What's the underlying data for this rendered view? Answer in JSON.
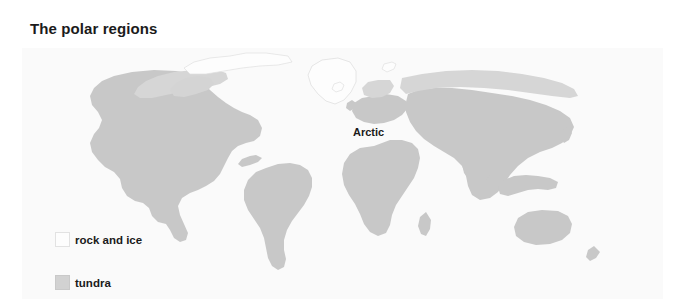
{
  "figure": {
    "title": "The polar regions",
    "background_color": "#ffffff",
    "panel_color": "#fafafa"
  },
  "map": {
    "type": "world-map",
    "projection": "robinson",
    "land_color": "#c8c8c8",
    "tundra_color": "#d6d6d6",
    "ice_color": "#fdfdfd",
    "outline_color": "#dcdcdc",
    "labels": [
      {
        "name": "arctic",
        "text": "Arctic"
      },
      {
        "name": "antarctic",
        "text": "Antarctic"
      }
    ]
  },
  "legend": {
    "items": [
      {
        "name": "rock-and-ice",
        "label": "rock and ice",
        "color": "#fdfdfd",
        "border": "#e2e2e2"
      },
      {
        "name": "tundra",
        "label": "tundra",
        "color": "#d2d2d2",
        "border": "#c9c9c9"
      }
    ]
  }
}
